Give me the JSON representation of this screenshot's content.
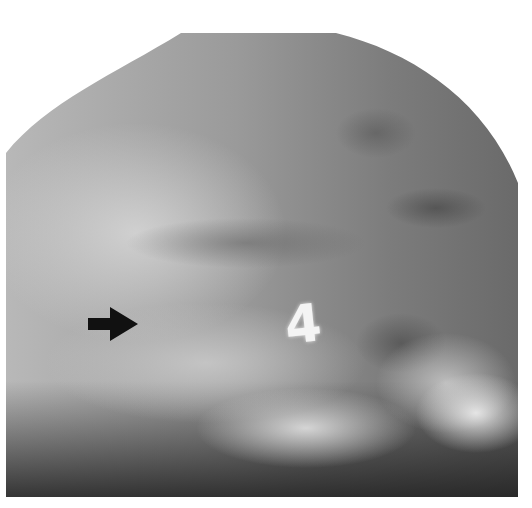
{
  "figure": {
    "type": "grayscale radiograph",
    "marker_label": "4",
    "annotations": [
      {
        "type": "arrow",
        "direction": "right",
        "color": "#111111"
      }
    ],
    "colors": {
      "background": "#ffffff",
      "film_mid_gray": "#9a9a9a",
      "film_dark": "#3a3a3a",
      "marker": "#f4f4f4",
      "arrow": "#111111"
    }
  }
}
